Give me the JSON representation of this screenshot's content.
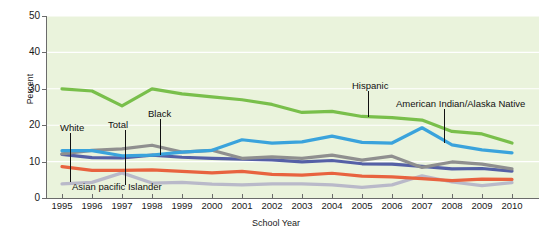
{
  "chart_data": {
    "type": "line",
    "title": "",
    "xlabel": "School Year",
    "ylabel": "Percent",
    "ylim": [
      0,
      50
    ],
    "yticks": [
      0,
      10,
      20,
      30,
      40,
      50
    ],
    "grid": true,
    "legend_position": "inline-annotations",
    "plot_background": "#eaf3dc",
    "gridline_color": "#ffffff",
    "categories": [
      "1995",
      "1996",
      "1997",
      "1998",
      "1999",
      "2000",
      "2001",
      "2002",
      "2003",
      "2004",
      "2005",
      "2006",
      "2007",
      "2008",
      "2009",
      "2010"
    ],
    "x": [
      1995,
      1996,
      1997,
      1998,
      1999,
      2000,
      2001,
      2002,
      2003,
      2004,
      2005,
      2006,
      2007,
      2008,
      2009,
      2010
    ],
    "series": [
      {
        "name": "Hispanic",
        "color": "#79bf4b",
        "values": [
          30.0,
          29.4,
          25.3,
          30.0,
          28.6,
          27.8,
          27.0,
          25.7,
          23.5,
          23.8,
          22.4,
          22.1,
          21.4,
          18.3,
          17.6,
          15.1
        ]
      },
      {
        "name": "American Indian/Alaska Native",
        "color": "#3aa3dc",
        "values": [
          13.0,
          13.0,
          11.6,
          11.8,
          12.6,
          13.1,
          16.0,
          15.1,
          15.4,
          17.0,
          15.3,
          15.1,
          19.3,
          14.6,
          13.2,
          12.4
        ]
      },
      {
        "name": "Black",
        "color": "#8f8f8f",
        "values": [
          12.1,
          13.1,
          13.5,
          14.5,
          12.6,
          13.1,
          10.9,
          11.3,
          10.9,
          11.8,
          10.4,
          11.5,
          8.4,
          9.9,
          9.3,
          8.0
        ]
      },
      {
        "name": "Total",
        "color": "#5560a6",
        "values": [
          12.0,
          11.1,
          11.0,
          11.8,
          11.2,
          10.9,
          10.7,
          10.5,
          9.9,
          10.3,
          9.4,
          9.3,
          8.7,
          8.0,
          8.1,
          7.4
        ]
      },
      {
        "name": "White",
        "color": "#e8633f",
        "values": [
          8.6,
          7.6,
          7.6,
          7.7,
          7.3,
          6.9,
          7.3,
          6.5,
          6.3,
          6.8,
          6.0,
          5.8,
          5.3,
          4.8,
          5.2,
          5.1
        ]
      },
      {
        "name": "Asian pacific Islander",
        "color": "#b9b9c9",
        "values": [
          3.9,
          4.3,
          6.9,
          4.1,
          4.3,
          3.8,
          3.6,
          3.9,
          3.9,
          3.6,
          2.9,
          3.6,
          6.1,
          4.4,
          3.4,
          4.2
        ]
      }
    ],
    "annotations": [
      {
        "text": "White",
        "label_x": 60,
        "label_y": 122,
        "leader_x": 70,
        "leader_top": 133,
        "leader_bottom": 182
      },
      {
        "text": "Total",
        "label_x": 108,
        "label_y": 119,
        "leader_x": 125,
        "leader_top": 130,
        "leader_bottom": 185
      },
      {
        "text": "Black",
        "label_x": 148,
        "label_y": 108,
        "leader_x": 160,
        "leader_top": 119,
        "leader_bottom": 155
      },
      {
        "text": "Asian pacific Islander",
        "label_x": 72,
        "label_y": 181,
        "leader_x": 125,
        "leader_top": 170,
        "leader_bottom": 181
      },
      {
        "text": "Hispanic",
        "label_x": 352,
        "label_y": 80,
        "leader_x": 368,
        "leader_top": 91,
        "leader_bottom": 117
      },
      {
        "text": "American Indian/Alaska Native",
        "label_x": 396,
        "label_y": 98,
        "leader_x": 444,
        "leader_top": 109,
        "leader_bottom": 143
      }
    ]
  }
}
